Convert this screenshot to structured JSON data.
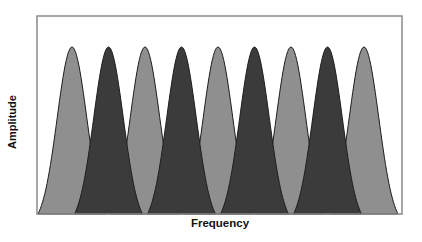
{
  "chart_data": {
    "type": "area",
    "title": "",
    "xlabel": "Frequency",
    "ylabel": "Amplitude",
    "grid": false,
    "legend": null,
    "x_ticks": [],
    "y_ticks": [],
    "peak_amplitude": 1.0,
    "series": [
      {
        "name": "light-channels",
        "color": "#8f8f8f",
        "centers": [
          1,
          3,
          5,
          7,
          9
        ],
        "values": [
          1,
          1,
          1,
          1,
          1
        ]
      },
      {
        "name": "dark-channels",
        "color": "#3b3b3b",
        "centers": [
          2,
          4,
          6,
          8
        ],
        "values": [
          1,
          1,
          1,
          1
        ]
      }
    ],
    "peak_centers_px": [
      72,
      108.5,
      145,
      181.5,
      218,
      254.5,
      291,
      327.5,
      364
    ],
    "peak_top_px": 47,
    "baseline_px": 214,
    "half_base_px": 34
  },
  "colors": {
    "light": "#8f8f8f",
    "dark": "#3b3b3b",
    "outline": "#1e1e1e",
    "frame": "#8a8a8a"
  },
  "frame": {
    "left": 37,
    "top": 16,
    "right": 402,
    "bottom": 214
  }
}
